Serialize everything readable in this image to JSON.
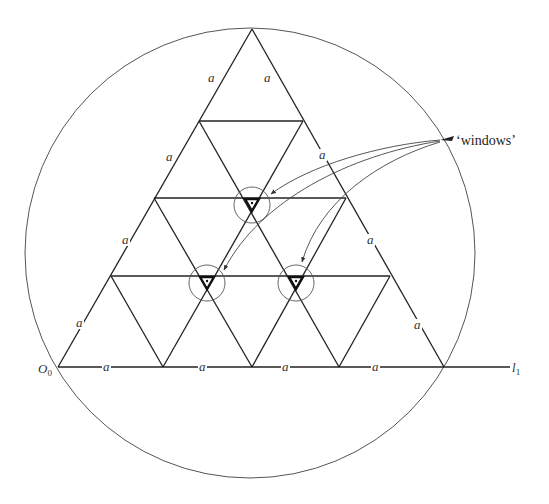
{
  "diagram": {
    "colors": {
      "stroke": "#222222",
      "circle": "#555555",
      "background": "#ffffff"
    },
    "outer_circle": {
      "cx": 250,
      "cy": 253,
      "r": 225
    },
    "triangle": {
      "apex": [
        252,
        29
      ],
      "base_left": [
        58,
        367
      ],
      "base_right": [
        444,
        367
      ]
    },
    "horizontal_lines": [
      {
        "y": 121,
        "x1": 199,
        "x2": 303
      },
      {
        "y": 198,
        "x1": 154,
        "x2": 346
      },
      {
        "y": 276,
        "x1": 111,
        "x2": 390
      }
    ],
    "baseline": {
      "y": 367,
      "x1": 58,
      "x2": 510
    },
    "diagonals": [
      [
        199,
        121,
        339,
        367
      ],
      [
        303,
        121,
        163,
        367
      ],
      [
        154,
        198,
        252,
        367
      ],
      [
        346,
        198,
        252,
        367
      ],
      [
        111,
        276,
        163,
        367
      ],
      [
        390,
        276,
        339,
        367
      ]
    ],
    "windows": [
      {
        "name": "window-top",
        "cx": 252,
        "cy": 205,
        "r": 18,
        "tri": [
          [
            245,
            199
          ],
          [
            259,
            199
          ],
          [
            252,
            211
          ]
        ],
        "dot": [
          252,
          203
        ]
      },
      {
        "name": "window-lower-left",
        "cx": 207,
        "cy": 283,
        "r": 18,
        "tri": [
          [
            200,
            277
          ],
          [
            214,
            277
          ],
          [
            207,
            289
          ]
        ],
        "dot": [
          207,
          281
        ]
      },
      {
        "name": "window-lower-right",
        "cx": 296,
        "cy": 283,
        "r": 18,
        "tri": [
          [
            289,
            277
          ],
          [
            303,
            277
          ],
          [
            296,
            289
          ]
        ],
        "dot": [
          296,
          281
        ]
      }
    ],
    "arrows": [
      {
        "d": "M 440 140 C 380 145, 310 165, 271 194",
        "tip": [
          271,
          194
        ]
      },
      {
        "d": "M 440 141 C 350 155, 260 200, 224 270",
        "tip": [
          224,
          270
        ]
      },
      {
        "d": "M 440 142 C 380 160, 320 200, 302 262",
        "tip": [
          302,
          262
        ]
      }
    ],
    "labels": {
      "origin": "O",
      "origin_sub": "0",
      "line": "l",
      "line_sub": "1",
      "callout": "‘windows’",
      "side_length": "a"
    },
    "side_labels": [
      {
        "x": 211,
        "y": 82
      },
      {
        "x": 267,
        "y": 82
      },
      {
        "x": 169,
        "y": 161
      },
      {
        "x": 322,
        "y": 159
      },
      {
        "x": 125,
        "y": 244
      },
      {
        "x": 370,
        "y": 244
      },
      {
        "x": 79,
        "y": 327
      },
      {
        "x": 417,
        "y": 329
      },
      {
        "x": 106,
        "y": 371
      },
      {
        "x": 202,
        "y": 371
      },
      {
        "x": 285,
        "y": 371
      },
      {
        "x": 375,
        "y": 371
      }
    ]
  }
}
